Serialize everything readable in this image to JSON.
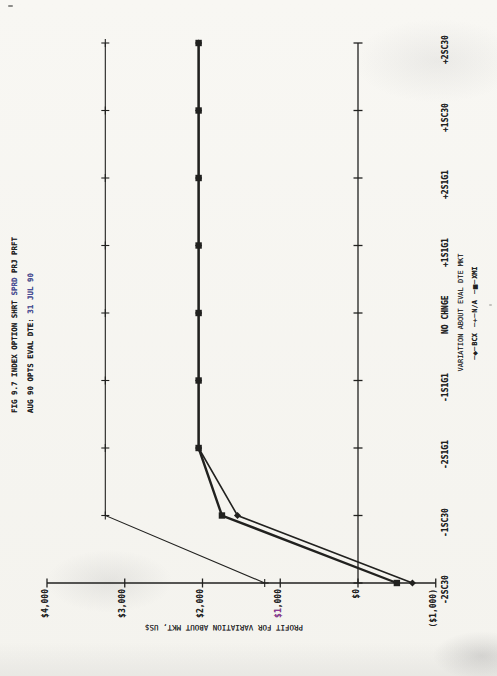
{
  "page": {
    "paper_color": "#f7f6f2",
    "ink_color": "#21211f",
    "artifact_blue": "#4a4f9e",
    "artifact_magenta": "#8e3a96"
  },
  "title": {
    "line1": "FIG 9.7 INDEX OPTION SHRT SPRD PRJ PRFT",
    "line2": "AUG 90 OPTS EVAL DTE: 31 JUL 90",
    "line1_parts": [
      {
        "t": "FIG 9.7 INDEX OPTION SHRT "
      },
      {
        "t": "SPRD",
        "c": "#4a4f9e"
      },
      {
        "t": " PRJ PRFT"
      }
    ],
    "line2_parts": [
      {
        "t": "AUG 90 OPTS EVAL DTE: "
      },
      {
        "t": "31 JUL 90",
        "c": "#4a4f9e"
      }
    ]
  },
  "chart_data": {
    "type": "line",
    "title": "FIG 9.7 INDEX OPTION SHRT SPRD PRJ PRFT",
    "subtitle": "AUG 90 OPTS EVAL DTE: 31 JUL 90",
    "orientation": "chart printed rotated 90deg CCW on portrait scanned page",
    "xlabel": "VARIATION ABOUT EVAL DTE MKT",
    "ylabel": "PROFIT FOR VARIATION ABOUT MKT, US$",
    "categories": [
      "-2SC30",
      "-1SC30",
      "-2S1G1",
      "-1S1G1",
      "NO CHNGE",
      "+1S1G1",
      "+2S1G1",
      "+1SC30",
      "+2SC30"
    ],
    "ylim": [
      -1000,
      4000
    ],
    "grid": false,
    "zero_axis": true,
    "yticks": [
      {
        "value": 4000,
        "label": "$4,000"
      },
      {
        "value": 3000,
        "label": "$3,000"
      },
      {
        "value": 2000,
        "label": "$2,000"
      },
      {
        "value": 1000,
        "label": "$1,000",
        "parts": [
          {
            "t": "$1",
            "c": "#8e3a96"
          },
          {
            "t": ",000"
          }
        ]
      },
      {
        "value": 0,
        "label": "$0"
      },
      {
        "value": -1000,
        "label": "($1,000)"
      }
    ],
    "series": [
      {
        "name": "BCX",
        "marker": "diamond",
        "values": [
          -700,
          1550,
          2050,
          2050,
          2050,
          2050,
          2050,
          2050,
          2050
        ]
      },
      {
        "name": "N/A",
        "marker": "plus",
        "values": [
          1200,
          3250,
          3250,
          3250,
          3250,
          3250,
          3250,
          3250,
          3250
        ]
      },
      {
        "name": "XMI",
        "marker": "square",
        "values": [
          -500,
          1750,
          2050,
          2050,
          2050,
          2050,
          2050,
          2050,
          2050
        ]
      }
    ],
    "legend": {
      "position": "beside category axis, below axis title",
      "items": [
        {
          "marker_glyph": "◆",
          "label": "BCX"
        },
        {
          "marker_glyph": "+",
          "label": "N/A"
        },
        {
          "marker_glyph": "■",
          "label": "XMI"
        }
      ]
    }
  }
}
